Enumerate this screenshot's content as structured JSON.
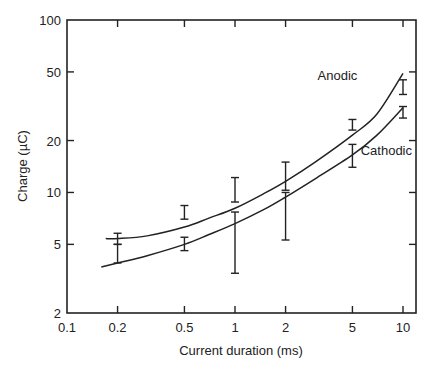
{
  "chart_data": {
    "type": "line",
    "title": "",
    "xlabel": "Current duration (ms)",
    "ylabel": "Charge (µC)",
    "xscale": "log",
    "yscale": "log",
    "xlim": [
      0.1,
      12
    ],
    "ylim": [
      2,
      100
    ],
    "grid": false,
    "legend": "inline labels",
    "x_ticks": [
      0.1,
      0.2,
      0.5,
      1,
      2,
      5,
      10
    ],
    "x_tick_labels": [
      "0.1",
      "0.2",
      "0.5",
      "1",
      "2",
      "5",
      "10"
    ],
    "y_ticks": [
      2,
      5,
      10,
      20,
      50,
      100
    ],
    "y_tick_labels": [
      "2",
      "5",
      "10",
      "20",
      "50",
      "100"
    ],
    "series": [
      {
        "name": "Anodic",
        "label_pos": [
          3.1,
          45
        ],
        "curve": {
          "x": [
            0.17,
            0.2,
            0.3,
            0.5,
            0.7,
            1,
            1.5,
            2,
            3,
            5,
            7,
            10
          ],
          "y": [
            5.4,
            5.4,
            5.6,
            6.3,
            7.1,
            8.1,
            9.9,
            11.6,
            15.0,
            21.5,
            28.5,
            49
          ]
        },
        "error_bars": [
          {
            "x": 0.2,
            "low": 5.0,
            "high": 5.8
          },
          {
            "x": 0.5,
            "low": 7.0,
            "high": 8.4
          },
          {
            "x": 1,
            "low": 8.8,
            "high": 12.2
          },
          {
            "x": 2,
            "low": 10.3,
            "high": 15.0
          },
          {
            "x": 5,
            "low": 23.0,
            "high": 26.5
          },
          {
            "x": 10,
            "low": 37.0,
            "high": 45.0
          }
        ]
      },
      {
        "name": "Cathodic",
        "label_pos": [
          5.6,
          16.5
        ],
        "curve": {
          "x": [
            0.16,
            0.2,
            0.3,
            0.5,
            0.7,
            1,
            1.5,
            2,
            3,
            5,
            7,
            10
          ],
          "y": [
            3.7,
            3.9,
            4.3,
            5.0,
            5.7,
            6.6,
            8.0,
            9.4,
            12.0,
            16.5,
            21.5,
            31
          ]
        },
        "error_bars": [
          {
            "x": 0.2,
            "low": 3.9,
            "high": 5.0
          },
          {
            "x": 0.5,
            "low": 4.6,
            "high": 5.5
          },
          {
            "x": 1,
            "low": 3.4,
            "high": 7.7
          },
          {
            "x": 2,
            "low": 5.3,
            "high": 10.0
          },
          {
            "x": 5,
            "low": 14.0,
            "high": 19.0
          },
          {
            "x": 10,
            "low": 27.0,
            "high": 31.5
          }
        ]
      }
    ]
  },
  "colors": {
    "line": "#222222",
    "background": "#ffffff"
  }
}
